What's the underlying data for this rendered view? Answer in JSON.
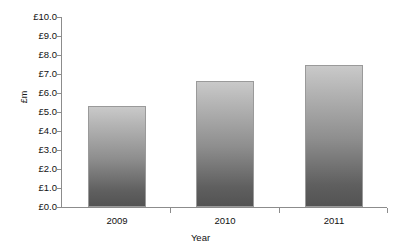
{
  "chart_data": {
    "type": "bar",
    "title": "",
    "subtitle": "",
    "categories": [
      "2009",
      "2010",
      "2011"
    ],
    "values": [
      5.3,
      6.65,
      7.5
    ],
    "series": [
      {
        "name": "Value",
        "values": [
          5.3,
          6.65,
          7.5
        ]
      }
    ],
    "xlabel": "Year",
    "ylabel": "£m",
    "ylim": [
      0,
      10
    ],
    "ytick_step": 1,
    "ytick_labels": [
      "£10.0",
      "£9.0",
      "£8.0",
      "£7.0",
      "£6.0",
      "£5.0",
      "£4.0",
      "£3.0",
      "£2.0",
      "£1.0",
      "£0.0"
    ],
    "ytick_values": [
      10,
      9,
      8,
      7,
      6,
      5,
      4,
      3,
      2,
      1,
      0
    ],
    "xtick_labels": [
      "2009",
      "2010",
      "2011"
    ],
    "grid": false,
    "legend": false,
    "legend_position": "none",
    "annotations": [],
    "colors": {
      "bar_gradient_top": "#c9c9c9",
      "bar_gradient_bottom": "#535353",
      "bar_border": "#9a9a9a",
      "axis": "#8c8c8c",
      "text": "#111111",
      "background": "#ffffff"
    }
  }
}
